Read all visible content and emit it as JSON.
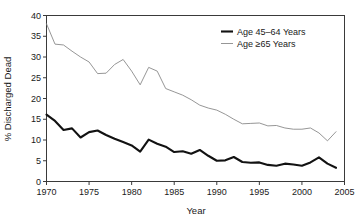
{
  "chart_data": {
    "type": "line",
    "title": "",
    "xlabel": "Year",
    "ylabel": "% Discharged Dead",
    "xlim": [
      1970,
      2005
    ],
    "ylim": [
      0,
      40
    ],
    "grid": false,
    "legend_position": "top-right",
    "xticks": [
      "1970",
      "1975",
      "1980",
      "1985",
      "1990",
      "1995",
      "2000",
      "2005"
    ],
    "xtick_values": [
      1970,
      1975,
      1980,
      1985,
      1990,
      1995,
      2000,
      2005
    ],
    "yticks": [
      "0",
      "5",
      "10",
      "15",
      "20",
      "25",
      "30",
      "35",
      "40"
    ],
    "ytick_values": [
      0,
      5,
      10,
      15,
      20,
      25,
      30,
      35,
      40
    ],
    "x": [
      1970,
      1971,
      1972,
      1973,
      1974,
      1975,
      1976,
      1977,
      1978,
      1979,
      1980,
      1981,
      1982,
      1983,
      1984,
      1985,
      1986,
      1987,
      1988,
      1989,
      1990,
      1991,
      1992,
      1993,
      1994,
      1995,
      1996,
      1997,
      1998,
      1999,
      2000,
      2001,
      2002,
      2003,
      2004
    ],
    "series": [
      {
        "name": "Age 45–64 Years",
        "color": "#121212",
        "line_width": "thick",
        "values": [
          16.1,
          14.6,
          12.4,
          12.8,
          10.6,
          11.9,
          12.3,
          11.2,
          10.3,
          9.5,
          8.7,
          7.2,
          10.1,
          9.1,
          8.4,
          7.1,
          7.3,
          6.7,
          7.6,
          6.2,
          5.0,
          5.1,
          5.9,
          4.7,
          4.5,
          4.6,
          4.0,
          3.8,
          4.3,
          4.1,
          3.8,
          4.6,
          5.8,
          4.3,
          3.3
        ]
      },
      {
        "name": "Age ≥65 Years",
        "color": "#8a8a8a",
        "line_width": "thin",
        "values": [
          38.0,
          33.1,
          32.9,
          31.4,
          30.0,
          28.8,
          26.0,
          26.1,
          28.2,
          29.4,
          26.6,
          23.3,
          27.5,
          26.6,
          22.4,
          21.6,
          20.8,
          19.7,
          18.4,
          17.7,
          17.2,
          16.2,
          15.0,
          13.9,
          14.0,
          14.1,
          13.4,
          13.5,
          12.9,
          12.6,
          12.6,
          12.9,
          11.7,
          9.8,
          12.0
        ]
      }
    ]
  },
  "legend": {
    "items": [
      {
        "label": "Age 45–64 Years"
      },
      {
        "label": "Age ≥65 Years"
      }
    ]
  },
  "axes": {
    "x_title": "Year",
    "y_title": "% Discharged Dead"
  }
}
